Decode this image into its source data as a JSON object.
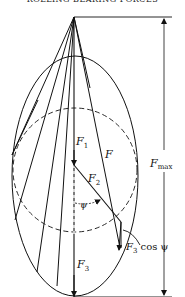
{
  "header": {
    "text": "ROLLING BEARING FORCES"
  },
  "labels": {
    "f1": "F",
    "f1_sub": "1",
    "f2": "F",
    "f2_sub": "2",
    "f3": "F",
    "f3_sub": "3",
    "f": "F",
    "fmax": "F",
    "fmax_sub": "max",
    "psi": "ψ",
    "f3cos": "F",
    "f3cos_sub": "3",
    "f3cos_tail": " cos ψ"
  },
  "colors": {
    "line": "#111111",
    "background": "#ffffff"
  }
}
